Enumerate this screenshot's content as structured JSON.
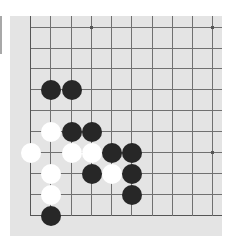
{
  "board": {
    "background": "#e4e4e4",
    "line_color": "#707070",
    "columns_x": [
      30,
      50,
      71,
      91,
      111,
      131,
      152,
      172,
      192,
      212
    ],
    "rows_y": [
      27,
      48,
      68,
      89,
      110,
      131,
      152,
      173,
      194,
      215
    ],
    "visible_edges": [
      "left",
      "bottom"
    ],
    "star_points": [
      {
        "col": 3,
        "row": 0
      },
      {
        "col": 9,
        "row": 0
      },
      {
        "col": 9,
        "row": 6
      }
    ],
    "stones": [
      {
        "color": "black",
        "col": 1,
        "row": 3
      },
      {
        "color": "black",
        "col": 2,
        "row": 3
      },
      {
        "color": "white",
        "col": 1,
        "row": 5
      },
      {
        "color": "black",
        "col": 2,
        "row": 5
      },
      {
        "color": "black",
        "col": 3,
        "row": 5
      },
      {
        "color": "white",
        "col": 0,
        "row": 6
      },
      {
        "color": "white",
        "col": 2,
        "row": 6
      },
      {
        "color": "white",
        "col": 3,
        "row": 6
      },
      {
        "color": "black",
        "col": 4,
        "row": 6
      },
      {
        "color": "black",
        "col": 5,
        "row": 6
      },
      {
        "color": "white",
        "col": 1,
        "row": 7
      },
      {
        "color": "black",
        "col": 3,
        "row": 7
      },
      {
        "color": "white",
        "col": 4,
        "row": 7
      },
      {
        "color": "black",
        "col": 5,
        "row": 7
      },
      {
        "color": "white",
        "col": 1,
        "row": 8
      },
      {
        "color": "black",
        "col": 5,
        "row": 8
      },
      {
        "color": "black",
        "col": 1,
        "row": 9
      }
    ]
  }
}
